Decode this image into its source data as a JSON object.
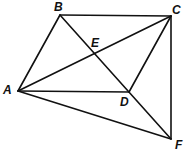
{
  "diagram": {
    "type": "geometry-figure",
    "points": {
      "A": {
        "label": "A",
        "x": 18,
        "y": 91
      },
      "B": {
        "label": "B",
        "x": 60,
        "y": 15
      },
      "C": {
        "label": "C",
        "x": 171,
        "y": 16
      },
      "D": {
        "label": "D",
        "x": 129,
        "y": 92
      },
      "E": {
        "label": "E",
        "x": 95,
        "y": 54
      },
      "F": {
        "label": "F",
        "x": 171,
        "y": 139
      }
    },
    "segments": [
      [
        "A",
        "B"
      ],
      [
        "B",
        "C"
      ],
      [
        "C",
        "F"
      ],
      [
        "A",
        "F"
      ],
      [
        "A",
        "D"
      ],
      [
        "A",
        "C"
      ],
      [
        "B",
        "F"
      ],
      [
        "C",
        "D"
      ]
    ],
    "line_color": "#111111"
  }
}
